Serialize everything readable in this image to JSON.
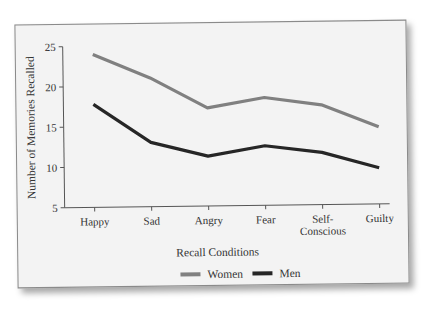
{
  "chart_data": {
    "type": "line",
    "title": "",
    "xlabel": "Recall Conditions",
    "ylabel": "Number of Memories Recalled",
    "categories": [
      "Happy",
      "Sad",
      "Angry",
      "Fear",
      "Self-Conscious",
      "Guilty"
    ],
    "category_lines": [
      [
        "Happy"
      ],
      [
        "Sad"
      ],
      [
        "Angry"
      ],
      [
        "Fear"
      ],
      [
        "Self-",
        "Conscious"
      ],
      [
        "Guilty"
      ]
    ],
    "series": [
      {
        "name": "Women",
        "color": "#808080",
        "values": [
          24,
          21,
          17.2,
          18.4,
          17.4,
          14.6
        ]
      },
      {
        "name": "Men",
        "color": "#262626",
        "values": [
          17.8,
          13,
          11.2,
          12.4,
          11.5,
          9.5
        ]
      }
    ],
    "yticks": [
      5,
      10,
      15,
      20,
      25
    ],
    "ylim": [
      5,
      25
    ],
    "grid": false,
    "legend_position": "bottom"
  }
}
